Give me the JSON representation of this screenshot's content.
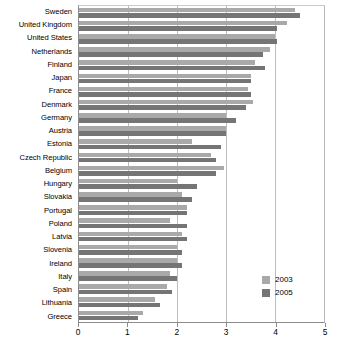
{
  "chart_data": {
    "type": "bar",
    "orientation": "horizontal",
    "title": "",
    "subtitle": "",
    "xlabel": "",
    "ylabel": "",
    "xlim": [
      0,
      5
    ],
    "xticks": [
      0,
      1,
      2,
      3,
      4,
      5
    ],
    "xtick_labels": [
      "0",
      "1",
      "2",
      "3",
      "4",
      "5"
    ],
    "grid": true,
    "legend_position": "bottom-right",
    "categories": [
      "Sweden",
      "United Kingdom",
      "United States",
      "Netherlands",
      "Finland",
      "Japan",
      "France",
      "Denmark",
      "Germany",
      "Austria",
      "Estonia",
      "Czech Republic",
      "Belgium",
      "Hungary",
      "Slovakia",
      "Portugal",
      "Poland",
      "Latvia",
      "Slovenia",
      "Ireland",
      "Italy",
      "Spain",
      "Lithuania",
      "Greece"
    ],
    "series": [
      {
        "name": "2003",
        "color": "#a9a9a9",
        "values": [
          4.4,
          4.25,
          4.0,
          3.9,
          3.6,
          3.5,
          3.45,
          3.55,
          3.0,
          3.0,
          2.3,
          2.7,
          2.95,
          2.0,
          2.1,
          2.2,
          1.85,
          2.1,
          2.0,
          2.0,
          1.85,
          1.8,
          1.55,
          1.3
        ]
      },
      {
        "name": "2005",
        "color": "#757575",
        "values": [
          4.5,
          4.05,
          4.05,
          3.75,
          3.8,
          3.5,
          3.5,
          3.4,
          3.2,
          3.0,
          2.9,
          2.8,
          2.8,
          2.4,
          2.3,
          2.2,
          2.2,
          2.2,
          2.1,
          2.1,
          2.0,
          1.9,
          1.65,
          1.2
        ]
      }
    ]
  },
  "legend": {
    "entries": [
      {
        "label": "2003",
        "color": "#a9a9a9"
      },
      {
        "label": "2005",
        "color": "#757575"
      }
    ]
  }
}
